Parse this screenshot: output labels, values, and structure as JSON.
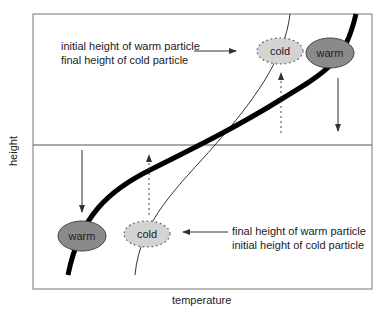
{
  "diagram": {
    "axes": {
      "x_label": "temperature",
      "y_label": "height"
    },
    "annotations": {
      "top_left": {
        "line1": "initial height of warm particle",
        "line2": "final height of cold particle"
      },
      "bottom_right": {
        "line1": "final height of warm particle",
        "line2": "initial height of cold particle"
      }
    },
    "particles": {
      "cold_top": {
        "label": "cold",
        "fill": "#d3d3d3",
        "style": "dotted-border"
      },
      "warm_top": {
        "label": "warm",
        "fill": "#8a8a8a",
        "style": "solid-border"
      },
      "warm_bottom": {
        "label": "warm",
        "fill": "#8a8a8a",
        "style": "solid-border"
      },
      "cold_bottom": {
        "label": "cold",
        "fill": "#d3d3d3",
        "style": "dotted-border"
      }
    },
    "curves": {
      "environment": "thick curve",
      "adiabat": "thin curve"
    },
    "colors": {
      "frame": "#666666",
      "thick_curve": "#000000",
      "thin_curve": "#333333",
      "warm_fill": "#8a8a8a",
      "cold_fill": "#d3d3d3"
    }
  }
}
